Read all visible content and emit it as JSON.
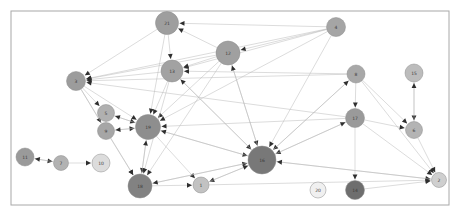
{
  "figure": {
    "type": "network-graph",
    "title": "",
    "background": "#ffffff",
    "frame": {
      "x": 11,
      "y": 11,
      "width": 438,
      "height": 194,
      "stroke": "#a8a8a8",
      "stroke_width": 1,
      "fill": "#ffffff"
    }
  },
  "style": {
    "edge_color": "#b8b8b8",
    "edge_width": 0.5,
    "arrow_color": "#2e2e2e",
    "node_stroke": "#8c8c8c",
    "label_color": "#3a3a3a",
    "label_size": 4.5
  },
  "chart_data": {
    "type": "scatter",
    "xlabel": "",
    "ylabel": "",
    "nodes": [
      {
        "id": "21",
        "label": "21",
        "x": 167,
        "y": 23,
        "r": 11.5,
        "color": "#9e9e9e"
      },
      {
        "id": "4",
        "label": "4",
        "x": 336,
        "y": 27,
        "r": 9.5,
        "color": "#a5a5a5"
      },
      {
        "id": "12",
        "label": "12",
        "x": 228,
        "y": 53,
        "r": 12.0,
        "color": "#a0a0a0"
      },
      {
        "id": "13",
        "label": "13",
        "x": 172,
        "y": 71,
        "r": 11.0,
        "color": "#a2a2a2"
      },
      {
        "id": "3",
        "label": "3",
        "x": 76,
        "y": 81,
        "r": 9.5,
        "color": "#9c9c9c"
      },
      {
        "id": "8",
        "label": "8",
        "x": 356,
        "y": 74,
        "r": 9.0,
        "color": "#a8a8a8"
      },
      {
        "id": "15",
        "label": "15",
        "x": 414,
        "y": 73,
        "r": 9.0,
        "color": "#bcbcbc"
      },
      {
        "id": "5",
        "label": "5",
        "x": 106,
        "y": 113,
        "r": 8.5,
        "color": "#b0b0b0"
      },
      {
        "id": "17",
        "label": "17",
        "x": 355,
        "y": 118,
        "r": 9.5,
        "color": "#9a9a9a"
      },
      {
        "id": "9",
        "label": "9",
        "x": 106,
        "y": 131,
        "r": 8.5,
        "color": "#a6a6a6"
      },
      {
        "id": "19",
        "label": "19",
        "x": 148,
        "y": 127,
        "r": 12.5,
        "color": "#8e8e8e"
      },
      {
        "id": "6",
        "label": "6",
        "x": 414,
        "y": 130,
        "r": 8.5,
        "color": "#b4b4b4"
      },
      {
        "id": "11",
        "label": "11",
        "x": 25,
        "y": 157,
        "r": 9.0,
        "color": "#9a9a9a"
      },
      {
        "id": "7",
        "label": "7",
        "x": 61,
        "y": 163,
        "r": 7.5,
        "color": "#b2b2b2"
      },
      {
        "id": "10",
        "label": "10",
        "x": 101,
        "y": 163,
        "r": 9.0,
        "color": "#dcdcdc"
      },
      {
        "id": "16",
        "label": "16",
        "x": 262,
        "y": 160,
        "r": 14.0,
        "color": "#787878"
      },
      {
        "id": "2",
        "label": "2",
        "x": 439,
        "y": 180,
        "r": 7.5,
        "color": "#cfcfcf"
      },
      {
        "id": "18",
        "label": "18",
        "x": 140,
        "y": 186,
        "r": 12.0,
        "color": "#828282"
      },
      {
        "id": "1",
        "label": "1",
        "x": 201,
        "y": 185,
        "r": 8.0,
        "color": "#c2c2c2"
      },
      {
        "id": "20",
        "label": "20",
        "x": 318,
        "y": 190,
        "r": 8.0,
        "color": "#f0f0f0"
      },
      {
        "id": "14",
        "label": "14",
        "x": 355,
        "y": 190,
        "r": 9.5,
        "color": "#6e6e6e"
      }
    ],
    "edges": [
      {
        "source": "21",
        "target": "3"
      },
      {
        "source": "21",
        "target": "13"
      },
      {
        "source": "21",
        "target": "19"
      },
      {
        "source": "12",
        "target": "21"
      },
      {
        "source": "4",
        "target": "21"
      },
      {
        "source": "4",
        "target": "3"
      },
      {
        "source": "4",
        "target": "13"
      },
      {
        "source": "4",
        "target": "12"
      },
      {
        "source": "4",
        "target": "19"
      },
      {
        "source": "4",
        "target": "16"
      },
      {
        "source": "12",
        "target": "13"
      },
      {
        "source": "12",
        "target": "3"
      },
      {
        "source": "12",
        "target": "19"
      },
      {
        "source": "12",
        "target": "16"
      },
      {
        "source": "12",
        "target": "18"
      },
      {
        "source": "13",
        "target": "3"
      },
      {
        "source": "13",
        "target": "19"
      },
      {
        "source": "13",
        "target": "18"
      },
      {
        "source": "13",
        "target": "16"
      },
      {
        "source": "8",
        "target": "3"
      },
      {
        "source": "8",
        "target": "13"
      },
      {
        "source": "8",
        "target": "17"
      },
      {
        "source": "8",
        "target": "16"
      },
      {
        "source": "8",
        "target": "6"
      },
      {
        "source": "8",
        "target": "2"
      },
      {
        "source": "15",
        "target": "6"
      },
      {
        "source": "6",
        "target": "15"
      },
      {
        "source": "17",
        "target": "3"
      },
      {
        "source": "17",
        "target": "19"
      },
      {
        "source": "17",
        "target": "16"
      },
      {
        "source": "17",
        "target": "6"
      },
      {
        "source": "17",
        "target": "14"
      },
      {
        "source": "17",
        "target": "2"
      },
      {
        "source": "3",
        "target": "19"
      },
      {
        "source": "3",
        "target": "5"
      },
      {
        "source": "3",
        "target": "9"
      },
      {
        "source": "3",
        "target": "18"
      },
      {
        "source": "5",
        "target": "19"
      },
      {
        "source": "5",
        "target": "9"
      },
      {
        "source": "9",
        "target": "19"
      },
      {
        "source": "9",
        "target": "18"
      },
      {
        "source": "19",
        "target": "18"
      },
      {
        "source": "19",
        "target": "16"
      },
      {
        "source": "19",
        "target": "1"
      },
      {
        "source": "19",
        "target": "5"
      },
      {
        "source": "19",
        "target": "9"
      },
      {
        "source": "11",
        "target": "7"
      },
      {
        "source": "7",
        "target": "10"
      },
      {
        "source": "7",
        "target": "11"
      },
      {
        "source": "18",
        "target": "16"
      },
      {
        "source": "18",
        "target": "1"
      },
      {
        "source": "18",
        "target": "19"
      },
      {
        "source": "16",
        "target": "1"
      },
      {
        "source": "16",
        "target": "2"
      },
      {
        "source": "16",
        "target": "19"
      },
      {
        "source": "16",
        "target": "18"
      },
      {
        "source": "16",
        "target": "12"
      },
      {
        "source": "16",
        "target": "13"
      },
      {
        "source": "16",
        "target": "8"
      },
      {
        "source": "16",
        "target": "17"
      },
      {
        "source": "1",
        "target": "16"
      },
      {
        "source": "1",
        "target": "2"
      },
      {
        "source": "14",
        "target": "2"
      },
      {
        "source": "6",
        "target": "2"
      },
      {
        "source": "2",
        "target": "16"
      }
    ],
    "legend": [],
    "grid": false
  }
}
